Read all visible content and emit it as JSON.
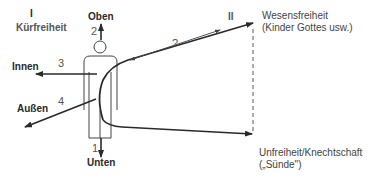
{
  "diagram": {
    "region_left": {
      "numeral": "I",
      "title": "Kürfreiheit"
    },
    "region_right": {
      "numeral": "II"
    },
    "directions": {
      "up": {
        "number": "2",
        "label": "Oben"
      },
      "down": {
        "number": "1",
        "label": "Unten"
      },
      "inner": {
        "number": "3",
        "label": "Innen"
      },
      "outer": {
        "number": "4",
        "label": "Außen"
      }
    },
    "question_mark": "?",
    "top_outcome": {
      "line1": "Wesensfreiheit",
      "line2": "(Kinder Gottes usw.)"
    },
    "bottom_outcome": {
      "line1": "Unfreiheit/Knechtschaft",
      "line2": "(„Sünde\")"
    },
    "colors": {
      "stroke": "#2a2a2a",
      "light_stroke": "#555555",
      "background": "#ffffff"
    }
  }
}
